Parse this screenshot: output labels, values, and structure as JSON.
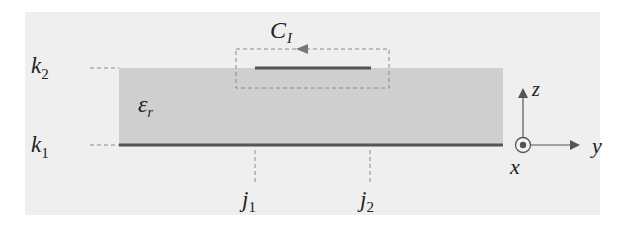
{
  "diagram": {
    "type": "cross-section of microstrip line over grounded dielectric",
    "colors": {
      "backdrop": "#efefef",
      "dielectric": "#cfcfcf",
      "conductor": "#555555",
      "dashed": "#8a8a8a",
      "text": "#222222"
    },
    "labels": {
      "contour": {
        "main": "C",
        "sub": "I"
      },
      "top_level": {
        "main": "k",
        "sub": "2"
      },
      "bottom_level": {
        "main": "k",
        "sub": "1"
      },
      "permittivity": {
        "main": "ε",
        "sub": "r"
      },
      "strip_left": {
        "main": "j",
        "sub": "1"
      },
      "strip_right": {
        "main": "j",
        "sub": "2"
      }
    },
    "axes": {
      "vertical": "z",
      "horizontal": "y",
      "out_of_page": "x"
    },
    "background_text": [
      "the ... when ... during ... this ... region of ...",
      "k ... ... ... ...",
      "... ... ... ... ...",
      "... ... ... ... ... ... ...",
      "... ... ... ... ... ..."
    ]
  }
}
